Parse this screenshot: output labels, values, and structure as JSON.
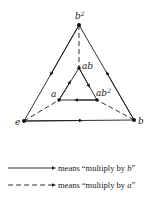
{
  "diagram": {
    "type": "cayley-graph",
    "nodes": [
      {
        "id": "b2",
        "label": "b",
        "sup": "2",
        "x": 79,
        "y": 25
      },
      {
        "id": "e",
        "label": "e",
        "sup": "",
        "x": 24,
        "y": 121
      },
      {
        "id": "b",
        "label": "b",
        "sup": "",
        "x": 134,
        "y": 120
      },
      {
        "id": "ab",
        "label": "ab",
        "sup": "",
        "x": 79,
        "y": 68
      },
      {
        "id": "a",
        "label": "a",
        "sup": "",
        "x": 59,
        "y": 100
      },
      {
        "id": "ab2",
        "label": "ab",
        "sup": "2",
        "x": 97,
        "y": 100
      }
    ],
    "edges": [
      {
        "from": "e",
        "to": "b",
        "style": "solid",
        "meaning": "multiply by b"
      },
      {
        "from": "b",
        "to": "b2",
        "style": "solid",
        "meaning": "multiply by b"
      },
      {
        "from": "b2",
        "to": "e",
        "style": "solid",
        "meaning": "multiply by b"
      },
      {
        "from": "a",
        "to": "ab",
        "style": "solid",
        "meaning": "multiply by b"
      },
      {
        "from": "ab",
        "to": "ab2",
        "style": "solid",
        "meaning": "multiply by b"
      },
      {
        "from": "ab2",
        "to": "a",
        "style": "solid",
        "meaning": "multiply by b"
      },
      {
        "from": "e",
        "to": "a",
        "style": "dashed",
        "meaning": "multiply by a"
      },
      {
        "from": "b",
        "to": "ab2",
        "style": "dashed",
        "meaning": "multiply by a"
      },
      {
        "from": "b2",
        "to": "ab",
        "style": "dashed",
        "meaning": "multiply by a"
      }
    ]
  },
  "labels": {
    "b2": "b",
    "b2_sup": "2",
    "e": "e",
    "b": "b",
    "ab": "ab",
    "a": "a",
    "ab2": "ab",
    "ab2_sup": "2"
  },
  "legend": {
    "solid": {
      "prefix": "means “multiply by ",
      "var": "b",
      "suffix": "”"
    },
    "dashed": {
      "prefix": "means “multiply by ",
      "var": "a",
      "suffix": "”"
    }
  }
}
